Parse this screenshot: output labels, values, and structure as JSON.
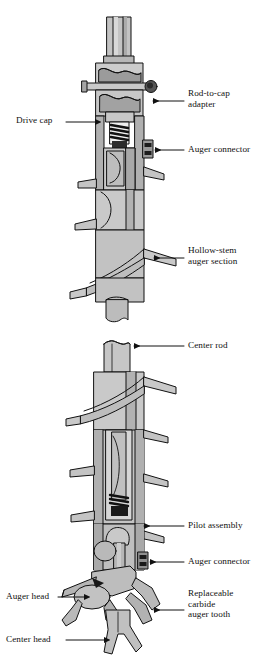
{
  "figure": {
    "type": "technical-cutaway-diagram",
    "background_color": "#ffffff",
    "line_color": "#111111",
    "palette": {
      "light_gray": "#d2d2d2",
      "mid_gray": "#b4b4b4",
      "dark_gray": "#8f8f8f",
      "deep_gray": "#6e6e6e",
      "black": "#111111"
    }
  },
  "labels": [
    {
      "id": "rod-to-cap-adapter",
      "text": "Rod-to-cap\nadapter",
      "side": "right",
      "x": 186,
      "y": 93,
      "leader": {
        "from_x": 184,
        "from_y": 101,
        "to_x": 151,
        "to_y": 101,
        "arrow": "left"
      }
    },
    {
      "id": "drive-cap",
      "text": "Drive cap",
      "side": "left",
      "x": 18,
      "y": 117,
      "leader": {
        "from_x": 66,
        "from_y": 122,
        "to_x": 97,
        "to_y": 122,
        "arrow": "right"
      }
    },
    {
      "id": "auger-connector-upper",
      "text": "Auger connector",
      "side": "right",
      "x": 186,
      "y": 145,
      "leader": {
        "from_x": 184,
        "from_y": 150,
        "to_x": 153,
        "to_y": 150,
        "arrow": "left"
      }
    },
    {
      "id": "hollow-stem-auger-section",
      "text": "Hollow-stem\nauger section",
      "side": "right",
      "x": 186,
      "y": 249,
      "leader": {
        "from_x": 184,
        "from_y": 258,
        "to_x": 152,
        "to_y": 258,
        "arrow": "left"
      }
    },
    {
      "id": "center-rod",
      "text": "Center rod",
      "side": "right",
      "x": 186,
      "y": 341,
      "leader": {
        "from_x": 184,
        "from_y": 346,
        "to_x": 134,
        "to_y": 346,
        "arrow": "left"
      }
    },
    {
      "id": "pilot-assembly",
      "text": "Pilot assembly",
      "side": "right",
      "x": 186,
      "y": 521,
      "leader": {
        "from_x": 184,
        "from_y": 526,
        "to_x": 142,
        "to_y": 526,
        "arrow": "left"
      }
    },
    {
      "id": "auger-connector-lower",
      "text": "Auger connector",
      "side": "right",
      "x": 186,
      "y": 557,
      "leader": {
        "from_x": 184,
        "from_y": 562,
        "to_x": 148,
        "to_y": 562,
        "arrow": "left"
      }
    },
    {
      "id": "auger-head",
      "text": "Auger head",
      "side": "left",
      "x": 8,
      "y": 592,
      "leader": {
        "from_x": 60,
        "from_y": 597,
        "to_x": 86,
        "to_y": 597,
        "arrow": "right"
      }
    },
    {
      "id": "replaceable-carbide-auger-tooth",
      "text": "Replaceable\ncarbide\nauger tooth",
      "side": "right",
      "x": 186,
      "y": 592,
      "leader": {
        "from_x": 184,
        "from_y": 610,
        "to_x": 152,
        "to_y": 610,
        "arrow": "left"
      }
    },
    {
      "id": "center-head",
      "text": "Center head",
      "side": "left",
      "x": 8,
      "y": 635,
      "leader": {
        "from_x": 68,
        "from_y": 640,
        "to_x": 106,
        "to_y": 640,
        "arrow": "right"
      }
    }
  ],
  "parts": {
    "upper_assembly": [
      "drive-rod-stub",
      "drive-cap-body",
      "cross-pin-bolt",
      "rod-to-cap-adapter",
      "internal-spring-detent",
      "auger-connector",
      "hollow-stem-auger-flights"
    ],
    "lower_assembly": [
      "center-rod",
      "hollow-stem-auger-flights",
      "pilot-assembly",
      "auger-connector",
      "auger-head",
      "replaceable-carbide-auger-tooth",
      "center-head"
    ]
  }
}
